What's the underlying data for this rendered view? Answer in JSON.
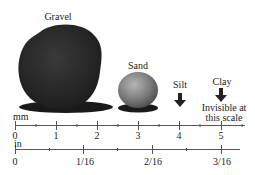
{
  "particles": [
    {
      "name": "Gravel",
      "label": "Gravel"
    },
    {
      "name": "Sand",
      "label": "Sand"
    },
    {
      "name": "Silt",
      "label": "Silt"
    },
    {
      "name": "Clay",
      "label": "Clay",
      "note": "Invisible at this scale",
      "note_line1": "Invisible at",
      "note_line2": "this scale"
    }
  ],
  "rulers": {
    "mm": {
      "unit": "mm",
      "ticks": [
        "0",
        "1",
        "2",
        "3",
        "4",
        "5"
      ]
    },
    "in": {
      "unit": "in",
      "ticks": [
        "0",
        "1/16",
        "2/16",
        "3/16"
      ]
    }
  },
  "colors": {
    "gravel": "#2b2b2b",
    "sand": "#8a8a8a",
    "shadow": "#1a1a1a",
    "ruler": "#555555"
  }
}
